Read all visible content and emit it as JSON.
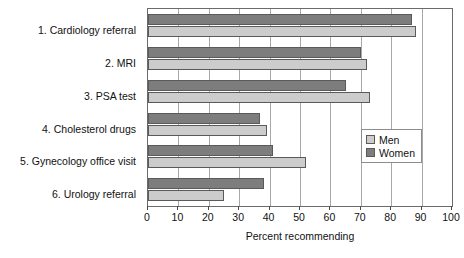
{
  "chart_data": {
    "type": "bar",
    "orientation": "horizontal",
    "title": "",
    "xlabel": "Percent recommending",
    "ylabel": "",
    "xlim": [
      0,
      100
    ],
    "xticks": [
      0,
      10,
      20,
      30,
      40,
      50,
      60,
      70,
      80,
      90,
      100
    ],
    "xtick_labels": [
      "0",
      "10",
      "20",
      "30",
      "40",
      "50",
      "60",
      "70",
      "80",
      "90",
      "100"
    ],
    "grid": true,
    "grid_axis": "x",
    "legend_position": "right-middle",
    "categories": [
      "1. Cardiology referral",
      "2. MRI",
      "3. PSA test",
      "4. Cholesterol drugs",
      "5. Gynecology office visit",
      "6. Urology referral"
    ],
    "series": [
      {
        "name": "Men",
        "color": "#cccccc",
        "values": [
          88,
          72,
          73,
          39,
          52,
          25
        ]
      },
      {
        "name": "Women",
        "color": "#7d7d7d",
        "values": [
          87,
          70,
          65,
          37,
          41,
          38
        ]
      }
    ]
  },
  "legend": {
    "items": [
      {
        "label": "Men",
        "swatch": "men"
      },
      {
        "label": "Women",
        "swatch": "women"
      }
    ]
  },
  "colors": {
    "men_bar": "#cccccc",
    "women_bar": "#7d7d7d",
    "bar_outline": "#5a5a5a",
    "gridline": "#a8a8a8",
    "axis": "#6b6b6b",
    "text": "#111111",
    "background": "#ffffff"
  }
}
